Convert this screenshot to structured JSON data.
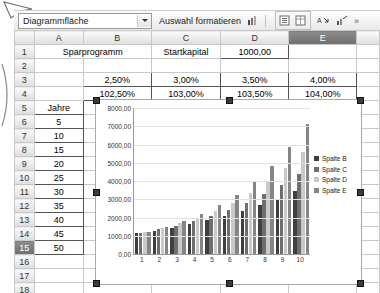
{
  "toolbar": {
    "namebox_value": "Diagrammfläche",
    "dropdown_icon": "chevron-down-icon",
    "format_selection_label": "Auswahl formatieren",
    "buttons": [
      {
        "name": "chart-type-icon",
        "glyph": "▐"
      },
      {
        "name": "legend-toggle-icon",
        "glyph": "≡"
      },
      {
        "name": "data-table-icon",
        "glyph": "⊞"
      },
      {
        "name": "text-angle-icon",
        "glyph": "A↘"
      },
      {
        "name": "axis-format-icon",
        "glyph": "↗"
      }
    ],
    "overflow_label": "»"
  },
  "sheet": {
    "columns": [
      "A",
      "B",
      "C",
      "D",
      "E"
    ],
    "selected_column": "E",
    "selected_row": "15",
    "rows": [
      {
        "num": "1",
        "cells": [
          "Sparprogramm",
          "",
          "Startkapital",
          "1000,00",
          ""
        ]
      },
      {
        "num": "2",
        "cells": [
          "",
          "",
          "",
          "",
          ""
        ]
      },
      {
        "num": "3",
        "cells": [
          "",
          "2,50%",
          "3,00%",
          "3,50%",
          "4,00%"
        ]
      },
      {
        "num": "4",
        "cells": [
          "",
          "102,50%",
          "103,00%",
          "103,50%",
          "104,00%"
        ]
      },
      {
        "num": "5",
        "cells": [
          "Jahre",
          "",
          "",
          "",
          ""
        ]
      },
      {
        "num": "6",
        "cells": [
          "5",
          "",
          "",
          "",
          ""
        ]
      },
      {
        "num": "7",
        "cells": [
          "10",
          "",
          "",
          "",
          ""
        ]
      },
      {
        "num": "8",
        "cells": [
          "15",
          "",
          "",
          "",
          ""
        ]
      },
      {
        "num": "9",
        "cells": [
          "20",
          "",
          "",
          "",
          ""
        ]
      },
      {
        "num": "10",
        "cells": [
          "25",
          "",
          "",
          "",
          ""
        ]
      },
      {
        "num": "11",
        "cells": [
          "30",
          "",
          "",
          "",
          ""
        ]
      },
      {
        "num": "12",
        "cells": [
          "35",
          "",
          "",
          "",
          ""
        ]
      },
      {
        "num": "13",
        "cells": [
          "40",
          "",
          "",
          "",
          ""
        ]
      },
      {
        "num": "14",
        "cells": [
          "45",
          "",
          "",
          "",
          ""
        ]
      },
      {
        "num": "15",
        "cells": [
          "50",
          "",
          "",
          "",
          ""
        ]
      },
      {
        "num": "16",
        "cells": [
          "",
          "",
          "",
          "",
          ""
        ]
      },
      {
        "num": "17",
        "cells": [
          "",
          "",
          "",
          "",
          ""
        ]
      },
      {
        "num": "18",
        "cells": [
          "",
          "",
          "",
          "",
          ""
        ]
      }
    ]
  },
  "chart_data": {
    "type": "bar",
    "title": "",
    "xlabel": "",
    "ylabel": "",
    "ylim": [
      0,
      8000
    ],
    "ytick_labels": [
      "8000,00",
      "7000,00",
      "6000,00",
      "5000,00",
      "4000,00",
      "3000,00",
      "2000,00",
      "1000,00",
      "0,00"
    ],
    "yticks": [
      8000,
      7000,
      6000,
      5000,
      4000,
      3000,
      2000,
      1000,
      0
    ],
    "categories": [
      "1",
      "2",
      "3",
      "4",
      "5",
      "6",
      "7",
      "8",
      "9",
      "10"
    ],
    "grid": true,
    "legend_position": "right",
    "series": [
      {
        "name": "Spalte B",
        "color": "#3f3f3f",
        "values": [
          1131,
          1280,
          1448,
          1639,
          1854,
          2098,
          2373,
          2685,
          3038,
          3437
        ]
      },
      {
        "name": "Spalte C",
        "color": "#6e6e6e",
        "values": [
          1159,
          1344,
          1558,
          1806,
          2094,
          2427,
          2814,
          3262,
          3782,
          4384
        ]
      },
      {
        "name": "Spalte D",
        "color": "#c9c9c9",
        "values": [
          1188,
          1411,
          1675,
          1990,
          2363,
          2807,
          3334,
          3959,
          4702,
          5585
        ]
      },
      {
        "name": "Spalte E",
        "color": "#858585",
        "values": [
          1217,
          1480,
          1801,
          2191,
          2666,
          3243,
          3946,
          4801,
          5841,
          7107
        ]
      }
    ]
  }
}
